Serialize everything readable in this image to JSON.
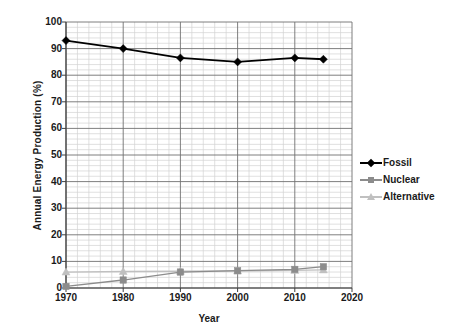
{
  "chart_data": {
    "type": "line",
    "title": "",
    "xlabel": "Year",
    "ylabel": "Annual Energy Production (%)",
    "xlim": [
      1970,
      2020
    ],
    "ylim": [
      0,
      100
    ],
    "x": [
      1970,
      1980,
      1990,
      2000,
      2010,
      2015
    ],
    "xticks": [
      1970,
      1980,
      1990,
      2000,
      2010,
      2020
    ],
    "yticks": [
      0,
      10,
      20,
      30,
      40,
      50,
      60,
      70,
      80,
      90,
      100
    ],
    "x_minor_step": 2,
    "y_minor_step": 2,
    "grid": true,
    "legend_position": "right",
    "series": [
      {
        "name": "Fossil",
        "color": "#000000",
        "marker": "diamond",
        "x": [
          1970,
          1980,
          1990,
          2000,
          2010,
          2015
        ],
        "values": [
          93,
          90,
          86.5,
          85,
          86.5,
          86
        ]
      },
      {
        "name": "Nuclear",
        "color": "#8c8c8c",
        "marker": "square",
        "x": [
          1970,
          1980,
          1990,
          2000,
          2010,
          2015
        ],
        "values": [
          0.6,
          3,
          6,
          6.5,
          7,
          8
        ]
      },
      {
        "name": "Alternative",
        "color": "#c0c0c0",
        "marker": "triangle",
        "x": [
          1970,
          1980,
          1990,
          2000,
          2010,
          2015
        ],
        "values": [
          6,
          6.2,
          6.3,
          6.4,
          6.6,
          6.8
        ]
      }
    ]
  },
  "axes": {
    "y_title": "Annual Energy Production (%)",
    "x_title": "Year",
    "y_tick_labels": [
      "100",
      "90",
      "80",
      "70",
      "60",
      "50",
      "40",
      "30",
      "20",
      "10",
      "0"
    ],
    "x_tick_labels": [
      "1970",
      "1980",
      "1990",
      "2000",
      "2010",
      "2020"
    ]
  },
  "legend": {
    "items": [
      {
        "label": "Fossil",
        "icon": "diamond-marker-icon"
      },
      {
        "label": "Nuclear",
        "icon": "square-marker-icon"
      },
      {
        "label": "Alternative",
        "icon": "triangle-marker-icon"
      }
    ]
  }
}
